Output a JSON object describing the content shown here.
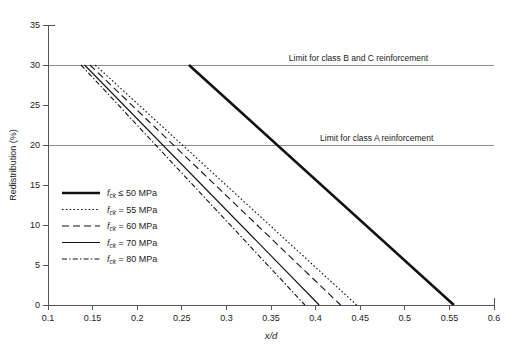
{
  "chart_data": {
    "type": "line",
    "title": "",
    "xlabel": "x/d",
    "ylabel": "Redistribution (%)",
    "xlim": [
      0.1,
      0.6
    ],
    "ylim": [
      0,
      35
    ],
    "xticks": [
      "0.1",
      "0.15",
      "0.2",
      "0.25",
      "0.3",
      "0.35",
      "0.4",
      "0.45",
      "0.5",
      "0.55",
      "0.6"
    ],
    "xtick_values": [
      0.1,
      0.15,
      0.2,
      0.25,
      0.3,
      0.35,
      0.4,
      0.45,
      0.5,
      0.55,
      0.6
    ],
    "yticks": [
      "0",
      "5",
      "10",
      "15",
      "20",
      "25",
      "30",
      "35"
    ],
    "ytick_values": [
      0,
      5,
      10,
      15,
      20,
      25,
      30,
      35
    ],
    "grid": false,
    "legend_position": "center-left",
    "series": [
      {
        "name": "fck_le_50",
        "label_main": "f",
        "label_sub": "ck",
        "label_rest": " ≤ 50 MPa",
        "style": "thick-solid",
        "stroke_width": 2.6,
        "dash": "none",
        "x": [
          0.258,
          0.555
        ],
        "y": [
          30,
          0
        ]
      },
      {
        "name": "fck_55",
        "label_main": "f",
        "label_sub": "ck",
        "label_rest": " = 55 MPa",
        "style": "dotted",
        "stroke_width": 1.1,
        "dash": "1.6,2.2",
        "x": [
          0.153,
          0.446
        ],
        "y": [
          30,
          0
        ]
      },
      {
        "name": "fck_60",
        "label_main": "f",
        "label_sub": "ck",
        "label_rest": " = 60 MPa",
        "style": "long-dash",
        "stroke_width": 1.1,
        "dash": "7,4",
        "x": [
          0.147,
          0.428
        ],
        "y": [
          30,
          0
        ]
      },
      {
        "name": "fck_70",
        "label_main": "f",
        "label_sub": "ck",
        "label_rest": " = 70 MPa",
        "style": "thin-solid",
        "stroke_width": 1.1,
        "dash": "none",
        "x": [
          0.141,
          0.404
        ],
        "y": [
          30,
          0
        ]
      },
      {
        "name": "fck_80",
        "label_main": "f",
        "label_sub": "ck",
        "label_rest": " = 80 MPa",
        "style": "dash-dot",
        "stroke_width": 1.1,
        "dash": "5,2.2,1.4,2.2",
        "x": [
          0.137,
          0.388
        ],
        "y": [
          30,
          0
        ]
      }
    ],
    "annotations": [
      {
        "name": "limit-class-b-c",
        "text": "Limit for class B and C reinforcement",
        "y_value": 30,
        "text_x": 0.37,
        "align": "start"
      },
      {
        "name": "limit-class-a",
        "text": "Limit for class A reinforcement",
        "y_value": 20,
        "text_x": 0.405,
        "align": "start"
      }
    ]
  },
  "colors": {
    "background": "#ffffff",
    "axis": "#555555",
    "gridline": "#8d8d8d",
    "series": "#111111",
    "text": "#1a1a1a"
  }
}
